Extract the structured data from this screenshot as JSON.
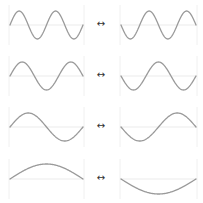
{
  "diagram": {
    "arrow_symbol": "↔",
    "colors": {
      "wave": "#9a9a9a",
      "guides": "#e6e6e6",
      "arrow": "#333333"
    },
    "rows": [
      {
        "cycles": 2.0,
        "midline_y": 25,
        "amplitude": 14,
        "left": "sin",
        "right": "-sin"
      },
      {
        "cycles": 1.5,
        "midline_y": 76,
        "amplitude": 14,
        "left": "sin",
        "right": "-sin"
      },
      {
        "cycles": 1.0,
        "midline_y": 127,
        "amplitude": 14,
        "left": "sin",
        "right": "-sin"
      },
      {
        "cycles": 0.5,
        "midline_y": 179,
        "amplitude": 15,
        "left": "sin",
        "right": "-sin"
      }
    ],
    "panels": {
      "left_x": [
        10,
        83
      ],
      "right_x": [
        121,
        196
      ]
    }
  }
}
